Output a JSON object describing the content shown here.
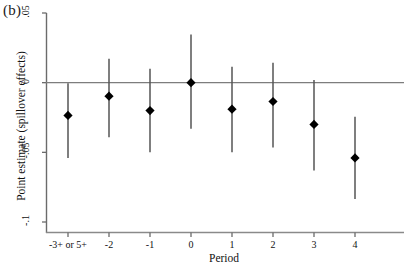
{
  "panel": {
    "label": "(b)"
  },
  "axes": {
    "ylabel": "Point estimate (spillover effects)",
    "xlabel": "Period"
  },
  "chart_data": {
    "type": "scatter",
    "title": "",
    "subtitle": "",
    "xlabel": "Period",
    "ylabel": "Point estimate (spillover effects)",
    "categories": [
      "-3+ or 5+",
      "-2",
      "-1",
      "0",
      "1",
      "2",
      "3",
      "4"
    ],
    "x": [
      -3,
      -2,
      -1,
      0,
      1,
      2,
      3,
      4
    ],
    "xtick_labels": [
      "-3+ or 5+",
      "-2",
      "-1",
      "0",
      "1",
      "2",
      "3",
      "4"
    ],
    "ytick_labels": [
      ".05",
      "0",
      "-.05",
      "-.1"
    ],
    "ytick_values": [
      0.05,
      0,
      -0.05,
      -0.1
    ],
    "ylim": [
      -0.1,
      0.05
    ],
    "xlim": [
      -3.6,
      4.6
    ],
    "grid": false,
    "legend": null,
    "zero_line": 0,
    "marker": "diamond",
    "marker_color": "#000000",
    "errorbar_color": "#555555",
    "values": [
      -0.0235,
      -0.0097,
      -0.02,
      0.0,
      -0.019,
      -0.0135,
      -0.03,
      -0.054
    ],
    "ci_low": [
      -0.054,
      -0.0392,
      -0.05,
      -0.033,
      -0.05,
      -0.0465,
      -0.063,
      -0.0835
    ],
    "ci_high": [
      -0.0005,
      0.0172,
      0.01,
      0.0345,
      0.0115,
      0.0143,
      0.0019,
      -0.0245
    ],
    "series": [
      {
        "name": "Spillover effects",
        "points": [
          {
            "x": -3,
            "xlabel": "-3+ or 5+",
            "y": -0.0235,
            "ci_low": -0.054,
            "ci_high": -0.0005
          },
          {
            "x": -2,
            "xlabel": "-2",
            "y": -0.0097,
            "ci_low": -0.0392,
            "ci_high": 0.0172
          },
          {
            "x": -1,
            "xlabel": "-1",
            "y": -0.02,
            "ci_low": -0.05,
            "ci_high": 0.01
          },
          {
            "x": 0,
            "xlabel": "0",
            "y": 0.0,
            "ci_low": -0.033,
            "ci_high": 0.0345
          },
          {
            "x": 1,
            "xlabel": "1",
            "y": -0.019,
            "ci_low": -0.05,
            "ci_high": 0.0115
          },
          {
            "x": 2,
            "xlabel": "2",
            "y": -0.0135,
            "ci_low": -0.0465,
            "ci_high": 0.0143
          },
          {
            "x": 3,
            "xlabel": "3",
            "y": -0.03,
            "ci_low": -0.063,
            "ci_high": 0.0019
          },
          {
            "x": 4,
            "xlabel": "4",
            "y": -0.054,
            "ci_low": -0.0835,
            "ci_high": -0.0245
          }
        ]
      }
    ]
  }
}
